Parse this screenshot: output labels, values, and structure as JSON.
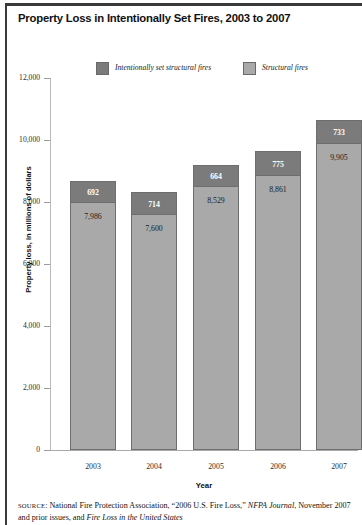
{
  "figure": {
    "title": "Property Loss in Intentionally Set Fires, 2003 to 2007"
  },
  "legend": {
    "items": [
      {
        "label": "Intentionally set structural fires",
        "color": "#7b7b7b"
      },
      {
        "label": "Structural fires",
        "color": "#a9a9a9"
      }
    ]
  },
  "source": {
    "prefix": "SOURCE",
    "line1_a": ": National Fire Protection Association, “2006 U.S. Fire Loss,” ",
    "line1_italic": "NFPA",
    "line2_italic_a": "Journal",
    "line2_b": ", November 2007 and prior issues, and ",
    "line2_italic_b": "Fire Loss in the United States"
  },
  "chart_data": {
    "type": "bar",
    "title": "Property Loss in Intentionally Set Fires, 2003 to 2007",
    "xlabel": "Year",
    "ylabel": "Property loss, in millions of dollars",
    "ylim": [
      0,
      12000
    ],
    "yticks": [
      0,
      2000,
      4000,
      6000,
      8000,
      10000,
      12000
    ],
    "ytick_labels": [
      "0",
      "2,000",
      "4,000",
      "6,000",
      "8,000",
      "10,000",
      "12,000"
    ],
    "grid": false,
    "stacked": true,
    "legend_position": "top",
    "categories": [
      "2003",
      "2004",
      "2005",
      "2006",
      "2007"
    ],
    "series": [
      {
        "name": "Structural fires",
        "color": "#a9a9a9",
        "values": [
          7986,
          7600,
          8529,
          8861,
          9905
        ],
        "value_labels": [
          "7,986",
          "7,600",
          "8,529",
          "8,861",
          "9,905"
        ]
      },
      {
        "name": "Intentionally set structural fires",
        "color": "#7b7b7b",
        "values": [
          692,
          714,
          664,
          775,
          733
        ],
        "value_labels": [
          "692",
          "714",
          "664",
          "775",
          "733"
        ]
      }
    ],
    "totals": [
      8678,
      8314,
      9193,
      9636,
      10638
    ]
  }
}
